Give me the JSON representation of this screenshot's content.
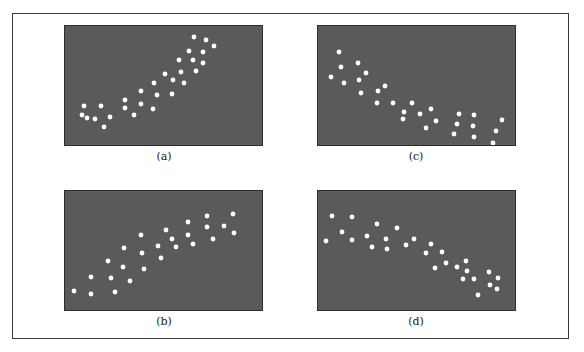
{
  "chart_data": [
    {
      "type": "scatter",
      "label": "(a)",
      "title": "",
      "xlabel": "",
      "ylabel": "",
      "description": "Positive correlation, tight",
      "points": [
        [
          129,
          11
        ],
        [
          141,
          14
        ],
        [
          149,
          20
        ],
        [
          124,
          25
        ],
        [
          138,
          26
        ],
        [
          114,
          34
        ],
        [
          128,
          34
        ],
        [
          138,
          37
        ],
        [
          116,
          46
        ],
        [
          131,
          45
        ],
        [
          100,
          48
        ],
        [
          108,
          54
        ],
        [
          119,
          57
        ],
        [
          89,
          57
        ],
        [
          76,
          65
        ],
        [
          92,
          69
        ],
        [
          107,
          68
        ],
        [
          60,
          74
        ],
        [
          76,
          78
        ],
        [
          60,
          82
        ],
        [
          88,
          83
        ],
        [
          69,
          89
        ],
        [
          19,
          80
        ],
        [
          36,
          80
        ],
        [
          17,
          89
        ],
        [
          22,
          92
        ],
        [
          30,
          93
        ],
        [
          45,
          91
        ],
        [
          39,
          101
        ]
      ]
    },
    {
      "type": "scatter",
      "label": "(b)",
      "title": "",
      "xlabel": "",
      "ylabel": "",
      "description": "Positive correlation, looser",
      "points": [
        [
          168,
          23
        ],
        [
          142,
          25
        ],
        [
          123,
          31
        ],
        [
          159,
          35
        ],
        [
          142,
          36
        ],
        [
          169,
          42
        ],
        [
          101,
          39
        ],
        [
          123,
          44
        ],
        [
          76,
          44
        ],
        [
          107,
          48
        ],
        [
          148,
          48
        ],
        [
          128,
          53
        ],
        [
          93,
          55
        ],
        [
          111,
          56
        ],
        [
          59,
          57
        ],
        [
          77,
          62
        ],
        [
          96,
          67
        ],
        [
          43,
          70
        ],
        [
          58,
          76
        ],
        [
          79,
          78
        ],
        [
          26,
          86
        ],
        [
          46,
          87
        ],
        [
          65,
          90
        ],
        [
          9,
          100
        ],
        [
          26,
          103
        ],
        [
          50,
          101
        ]
      ]
    },
    {
      "type": "scatter",
      "label": "(c)",
      "title": "",
      "xlabel": "",
      "ylabel": "",
      "description": "Negative correlation, tight",
      "points": [
        [
          21,
          26
        ],
        [
          23,
          41
        ],
        [
          40,
          37
        ],
        [
          48,
          47
        ],
        [
          13,
          51
        ],
        [
          26,
          57
        ],
        [
          41,
          54
        ],
        [
          43,
          67
        ],
        [
          60,
          65
        ],
        [
          67,
          60
        ],
        [
          59,
          77
        ],
        [
          75,
          77
        ],
        [
          94,
          77
        ],
        [
          86,
          86
        ],
        [
          85,
          93
        ],
        [
          102,
          88
        ],
        [
          113,
          83
        ],
        [
          118,
          95
        ],
        [
          108,
          102
        ],
        [
          141,
          88
        ],
        [
          139,
          98
        ],
        [
          136,
          108
        ],
        [
          156,
          89
        ],
        [
          155,
          100
        ],
        [
          156,
          111
        ],
        [
          184,
          94
        ],
        [
          178,
          105
        ],
        [
          175,
          117
        ]
      ]
    },
    {
      "type": "scatter",
      "label": "(d)",
      "title": "",
      "xlabel": "",
      "ylabel": "",
      "description": "Negative correlation, looser",
      "points": [
        [
          14,
          25
        ],
        [
          34,
          26
        ],
        [
          59,
          33
        ],
        [
          79,
          37
        ],
        [
          24,
          41
        ],
        [
          49,
          45
        ],
        [
          8,
          50
        ],
        [
          34,
          49
        ],
        [
          68,
          48
        ],
        [
          54,
          56
        ],
        [
          69,
          58
        ],
        [
          96,
          48
        ],
        [
          88,
          54
        ],
        [
          113,
          53
        ],
        [
          108,
          62
        ],
        [
          124,
          61
        ],
        [
          128,
          72
        ],
        [
          117,
          77
        ],
        [
          139,
          76
        ],
        [
          148,
          70
        ],
        [
          149,
          80
        ],
        [
          145,
          88
        ],
        [
          156,
          88
        ],
        [
          171,
          81
        ],
        [
          180,
          87
        ],
        [
          172,
          94
        ],
        [
          179,
          98
        ],
        [
          160,
          104
        ]
      ]
    }
  ],
  "panels": [
    {
      "key": "a",
      "caption": "(a)"
    },
    {
      "key": "b",
      "caption": "(b)"
    },
    {
      "key": "c",
      "caption": "(c)"
    },
    {
      "key": "d",
      "caption": "(d)"
    }
  ],
  "colors": {
    "panel_bg": "#5a5a5a",
    "dot": "#ffffff",
    "border": "#3a3a3a"
  }
}
